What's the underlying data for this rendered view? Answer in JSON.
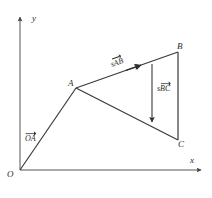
{
  "figure": {
    "background_color": "#ffffff",
    "stroke_color": "#3a3a3a",
    "axis_color": "#555555",
    "label_color": "#2b2b2b",
    "axes": {
      "x_label": "x",
      "y_label": "y",
      "origin_label": "O"
    },
    "points": [
      {
        "id": "O",
        "label": "O",
        "x": 20,
        "y": 170
      },
      {
        "id": "A",
        "label": "A",
        "x": 76,
        "y": 88
      },
      {
        "id": "B",
        "label": "B",
        "x": 178,
        "y": 52
      },
      {
        "id": "C",
        "label": "C",
        "x": 178,
        "y": 140
      }
    ],
    "vectors": [
      {
        "id": "OA",
        "scalar": "",
        "name": "OA",
        "label": "OA",
        "from": "O",
        "to": "A",
        "arrowhead": "none"
      },
      {
        "id": "sAB",
        "scalar": "s",
        "name": "AB",
        "label": "sAB",
        "from": "A",
        "to": "B",
        "arrowhead": "mid"
      },
      {
        "id": "sBC",
        "scalar": "s",
        "name": "BC",
        "label": "sBC",
        "from": "B",
        "to": "C",
        "arrowhead": "end"
      }
    ],
    "segments": [
      {
        "id": "OA-line",
        "from": "O",
        "to": "A"
      },
      {
        "id": "AB-line",
        "from": "A",
        "to": "B"
      },
      {
        "id": "BC-line",
        "from": "B",
        "to": "C"
      },
      {
        "id": "AC-line",
        "from": "A",
        "to": "C"
      }
    ]
  }
}
